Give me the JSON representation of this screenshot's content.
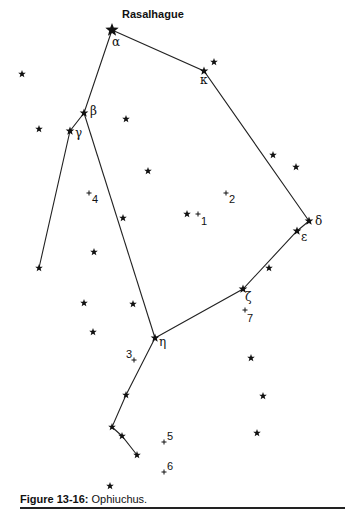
{
  "figure": {
    "caption_label": "Figure 13-16:",
    "caption_text": " Ophiuchus.",
    "line_color": "#222222",
    "star_color": "#111111"
  },
  "chart_data": {
    "type": "star-chart",
    "title": "Ophiuchus",
    "named_stars": [
      {
        "id": "alpha",
        "symbol": "α",
        "name": "Rasalhague",
        "x": 112,
        "y": 30,
        "size": "large",
        "lx": 112,
        "ly": 46
      },
      {
        "id": "kappa",
        "symbol": "κ",
        "x": 204,
        "y": 71,
        "size": "medium",
        "lx": 200,
        "ly": 84
      },
      {
        "id": "beta",
        "symbol": "β",
        "x": 84,
        "y": 113,
        "size": "medium",
        "lx": 90,
        "ly": 115
      },
      {
        "id": "gamma",
        "symbol": "γ",
        "x": 70,
        "y": 131,
        "size": "medium",
        "lx": 75,
        "ly": 137
      },
      {
        "id": "delta",
        "symbol": "δ",
        "x": 309,
        "y": 221,
        "size": "medium",
        "lx": 315,
        "ly": 225
      },
      {
        "id": "epsilon",
        "symbol": "ε",
        "x": 297,
        "y": 231,
        "size": "medium",
        "lx": 301,
        "ly": 241
      },
      {
        "id": "zeta",
        "symbol": "ζ",
        "x": 243,
        "y": 289,
        "size": "medium",
        "lx": 245,
        "ly": 301
      },
      {
        "id": "eta",
        "symbol": "η",
        "x": 155,
        "y": 338,
        "size": "medium",
        "lx": 159,
        "ly": 346
      }
    ],
    "other_stars": [
      {
        "x": 22,
        "y": 74
      },
      {
        "x": 214,
        "y": 62
      },
      {
        "x": 39,
        "y": 129
      },
      {
        "x": 126,
        "y": 119
      },
      {
        "x": 273,
        "y": 155
      },
      {
        "x": 296,
        "y": 167
      },
      {
        "x": 148,
        "y": 171
      },
      {
        "x": 123,
        "y": 218
      },
      {
        "x": 187,
        "y": 214
      },
      {
        "x": 94,
        "y": 252
      },
      {
        "x": 39,
        "y": 268
      },
      {
        "x": 269,
        "y": 268
      },
      {
        "x": 84,
        "y": 303
      },
      {
        "x": 133,
        "y": 304
      },
      {
        "x": 93,
        "y": 332
      },
      {
        "x": 251,
        "y": 358
      },
      {
        "x": 263,
        "y": 396
      },
      {
        "x": 126,
        "y": 395
      },
      {
        "x": 257,
        "y": 433
      },
      {
        "x": 112,
        "y": 427
      },
      {
        "x": 122,
        "y": 436
      },
      {
        "x": 137,
        "y": 455
      },
      {
        "x": 110,
        "y": 486
      }
    ],
    "deep_sky_objects": [
      {
        "label": "1",
        "x": 198,
        "y": 214,
        "lx": 201,
        "ly": 225
      },
      {
        "label": "2",
        "x": 226,
        "y": 193,
        "lx": 229,
        "ly": 203
      },
      {
        "label": "3",
        "x": 134,
        "y": 360,
        "lx": 126,
        "ly": 358
      },
      {
        "label": "4",
        "x": 89,
        "y": 193,
        "lx": 92,
        "ly": 203
      },
      {
        "label": "5",
        "x": 164,
        "y": 442,
        "lx": 167,
        "ly": 440
      },
      {
        "label": "6",
        "x": 164,
        "y": 472,
        "lx": 167,
        "ly": 470
      },
      {
        "label": "7",
        "x": 245,
        "y": 310,
        "lx": 247,
        "ly": 322
      }
    ],
    "lines": [
      [
        [
          112,
          30
        ],
        [
          84,
          113
        ],
        [
          70,
          131
        ],
        [
          39,
          268
        ]
      ],
      [
        [
          84,
          113
        ],
        [
          155,
          338
        ]
      ],
      [
        [
          112,
          30
        ],
        [
          204,
          71
        ],
        [
          309,
          221
        ]
      ],
      [
        [
          309,
          221
        ],
        [
          297,
          231
        ],
        [
          243,
          289
        ],
        [
          155,
          338
        ]
      ],
      [
        [
          155,
          338
        ],
        [
          126,
          395
        ],
        [
          112,
          427
        ],
        [
          122,
          436
        ],
        [
          137,
          455
        ]
      ]
    ]
  }
}
